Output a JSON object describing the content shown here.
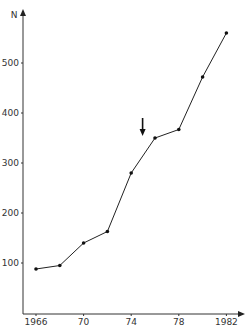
{
  "chart_data": {
    "type": "line",
    "title": "",
    "xlabel": "",
    "ylabel": "N",
    "x": [
      1966,
      1968,
      1970,
      1972,
      1974,
      1976,
      1978,
      1980,
      1982
    ],
    "series": [
      {
        "name": "N",
        "values": [
          88,
          95,
          140,
          163,
          280,
          350,
          367,
          472,
          560
        ]
      }
    ],
    "x_ticks": [
      1966,
      1970,
      1974,
      1978,
      1982
    ],
    "x_tick_labels": [
      "1966",
      "70",
      "74",
      "78",
      "1982"
    ],
    "y_ticks": [
      100,
      200,
      300,
      400,
      500
    ],
    "y_tick_labels": [
      "100",
      "200",
      "300",
      "400",
      "500"
    ],
    "xlim": [
      1965,
      1984
    ],
    "ylim": [
      0,
      600
    ],
    "grid": false,
    "legend": null,
    "annotations": [
      {
        "type": "arrow-down",
        "x": 1975,
        "pointing_at_value": 340
      }
    ]
  }
}
